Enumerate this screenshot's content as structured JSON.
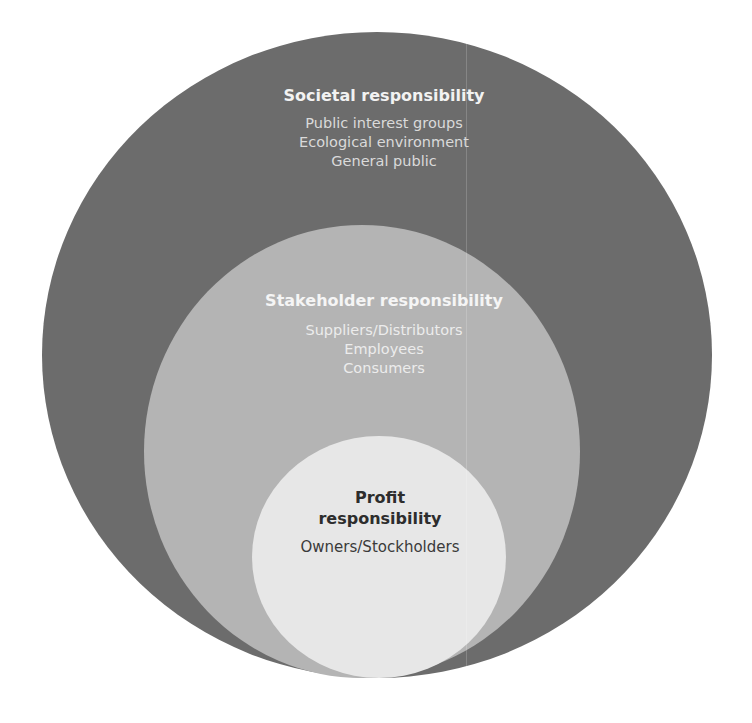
{
  "diagram": {
    "type": "nested-circles",
    "colors": {
      "outer": "#6c6c6c",
      "middle": "#b4b4b4",
      "inner": "#e7e7e7"
    },
    "levels": [
      {
        "id": "societal",
        "title": "Societal responsibility",
        "items": [
          "Public interest groups",
          "Ecological environment",
          "General public"
        ]
      },
      {
        "id": "stakeholder",
        "title": "Stakeholder responsibility",
        "items": [
          "Suppliers/Distributors",
          "Employees",
          "Consumers"
        ]
      },
      {
        "id": "profit",
        "title_line1": "Profit",
        "title_line2": "responsibility",
        "items": [
          "Owners/Stockholders"
        ]
      }
    ]
  }
}
